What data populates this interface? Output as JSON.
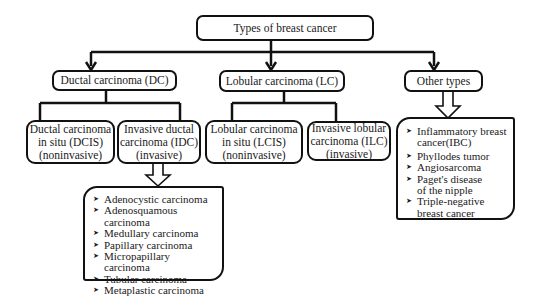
{
  "diagram": {
    "root": {
      "label": "Types of breast cancer"
    },
    "categories": [
      {
        "label": "Ductal carcinoma (DC)",
        "children": [
          {
            "line1": "Ductal carcinoma",
            "line2": "in situ (DCIS)",
            "line3": "(noninvasive)"
          },
          {
            "line1": "Invasive ductal",
            "line2": "carcinoma (IDC)",
            "line3": "(invasive)"
          }
        ],
        "subtypes": [
          "Adenocystic carcinoma",
          "Adenosquamous carcinoma",
          "Medullary carcinoma",
          "Papillary carcinoma",
          "Micropapillary carcinoma",
          "Tubular carcinoma",
          "Metaplastic carcinoma"
        ]
      },
      {
        "label": "Lobular carcinoma (LC)",
        "children": [
          {
            "line1": "Lobular carcinoma",
            "line2": "in situ (LCIS)",
            "line3": "(noninvasive)"
          },
          {
            "line1": "Invasive lobular",
            "line2": "carcinoma (ILC)",
            "line3": "(invasive)"
          }
        ]
      },
      {
        "label": "Other types",
        "subtypes": [
          "Inflammatory breast cancer(IBC)",
          "Phyllodes tumor",
          "Angiosarcoma",
          "Paget's disease of the nipple",
          "Triple-negative breast cancer"
        ]
      }
    ],
    "colors": {
      "line": "#111111",
      "background": "#ffffff",
      "text": "#1a1a1a"
    }
  }
}
